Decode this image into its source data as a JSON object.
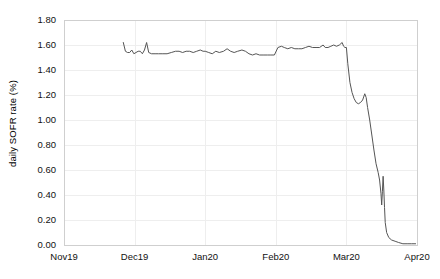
{
  "chart_data": {
    "type": "line",
    "title": "",
    "xlabel": "",
    "ylabel": "daily SOFR rate (%)",
    "ylim": [
      0.0,
      1.8
    ],
    "yticks": [
      "0.00",
      "0.20",
      "0.40",
      "0.60",
      "0.80",
      "1.00",
      "1.20",
      "1.40",
      "1.60",
      "1.80"
    ],
    "ytick_values": [
      0.0,
      0.2,
      0.4,
      0.6,
      0.8,
      1.0,
      1.2,
      1.4,
      1.6,
      1.8
    ],
    "xticks": [
      "Nov19",
      "Dec19",
      "Jan20",
      "Feb20",
      "Mar20",
      "Apr20"
    ],
    "xtick_values": [
      0,
      1,
      2,
      3,
      4,
      5
    ],
    "xlim": [
      0,
      5
    ],
    "grid": true,
    "legend": "none",
    "series": [
      {
        "name": "daily SOFR rate",
        "color": "#555555",
        "points": [
          [
            0.84,
            1.62
          ],
          [
            0.87,
            1.55
          ],
          [
            0.9,
            1.54
          ],
          [
            0.93,
            1.54
          ],
          [
            0.96,
            1.56
          ],
          [
            0.99,
            1.53
          ],
          [
            1.02,
            1.54
          ],
          [
            1.05,
            1.55
          ],
          [
            1.08,
            1.55
          ],
          [
            1.11,
            1.53
          ],
          [
            1.14,
            1.56
          ],
          [
            1.17,
            1.62
          ],
          [
            1.2,
            1.54
          ],
          [
            1.24,
            1.53
          ],
          [
            1.29,
            1.53
          ],
          [
            1.34,
            1.53
          ],
          [
            1.4,
            1.53
          ],
          [
            1.46,
            1.53
          ],
          [
            1.52,
            1.54
          ],
          [
            1.58,
            1.55
          ],
          [
            1.63,
            1.55
          ],
          [
            1.68,
            1.54
          ],
          [
            1.73,
            1.55
          ],
          [
            1.78,
            1.55
          ],
          [
            1.83,
            1.54
          ],
          [
            1.88,
            1.55
          ],
          [
            1.93,
            1.56
          ],
          [
            1.97,
            1.55
          ],
          [
            2.0,
            1.55
          ],
          [
            2.05,
            1.54
          ],
          [
            2.1,
            1.53
          ],
          [
            2.15,
            1.55
          ],
          [
            2.2,
            1.54
          ],
          [
            2.26,
            1.55
          ],
          [
            2.31,
            1.57
          ],
          [
            2.36,
            1.55
          ],
          [
            2.41,
            1.54
          ],
          [
            2.46,
            1.55
          ],
          [
            2.52,
            1.56
          ],
          [
            2.57,
            1.55
          ],
          [
            2.62,
            1.53
          ],
          [
            2.67,
            1.52
          ],
          [
            2.72,
            1.53
          ],
          [
            2.77,
            1.52
          ],
          [
            2.82,
            1.52
          ],
          [
            2.88,
            1.52
          ],
          [
            2.93,
            1.52
          ],
          [
            2.98,
            1.52
          ],
          [
            3.03,
            1.58
          ],
          [
            3.08,
            1.59
          ],
          [
            3.12,
            1.58
          ],
          [
            3.17,
            1.57
          ],
          [
            3.22,
            1.58
          ],
          [
            3.27,
            1.57
          ],
          [
            3.32,
            1.57
          ],
          [
            3.37,
            1.57
          ],
          [
            3.42,
            1.58
          ],
          [
            3.47,
            1.59
          ],
          [
            3.52,
            1.58
          ],
          [
            3.57,
            1.58
          ],
          [
            3.62,
            1.58
          ],
          [
            3.67,
            1.6
          ],
          [
            3.7,
            1.58
          ],
          [
            3.74,
            1.58
          ],
          [
            3.78,
            1.59
          ],
          [
            3.82,
            1.6
          ],
          [
            3.86,
            1.59
          ],
          [
            3.9,
            1.6
          ],
          [
            3.94,
            1.62
          ],
          [
            3.96,
            1.59
          ],
          [
            3.98,
            1.58
          ],
          [
            4.0,
            1.58
          ],
          [
            4.02,
            1.45
          ],
          [
            4.05,
            1.3
          ],
          [
            4.08,
            1.22
          ],
          [
            4.11,
            1.17
          ],
          [
            4.14,
            1.14
          ],
          [
            4.17,
            1.13
          ],
          [
            4.2,
            1.14
          ],
          [
            4.23,
            1.16
          ],
          [
            4.26,
            1.21
          ],
          [
            4.28,
            1.18
          ],
          [
            4.3,
            1.1
          ],
          [
            4.33,
            1.0
          ],
          [
            4.36,
            0.88
          ],
          [
            4.39,
            0.76
          ],
          [
            4.42,
            0.65
          ],
          [
            4.45,
            0.58
          ],
          [
            4.47,
            0.52
          ],
          [
            4.49,
            0.41
          ],
          [
            4.5,
            0.32
          ],
          [
            4.51,
            0.43
          ],
          [
            4.52,
            0.55
          ],
          [
            4.53,
            0.44
          ],
          [
            4.54,
            0.3
          ],
          [
            4.55,
            0.18
          ],
          [
            4.57,
            0.1
          ],
          [
            4.6,
            0.06
          ],
          [
            4.64,
            0.04
          ],
          [
            4.69,
            0.03
          ],
          [
            4.74,
            0.02
          ],
          [
            4.8,
            0.01
          ],
          [
            4.86,
            0.01
          ],
          [
            4.92,
            0.01
          ],
          [
            4.98,
            0.01
          ]
        ]
      }
    ],
    "colors": {
      "line": "#555555",
      "grid": "#eeeeee",
      "axis": "#cfcfcf",
      "text": "#111111",
      "background": "#ffffff"
    },
    "plot_box": {
      "left": 64,
      "top": 20,
      "right": 417,
      "bottom": 245
    }
  },
  "caption": ""
}
